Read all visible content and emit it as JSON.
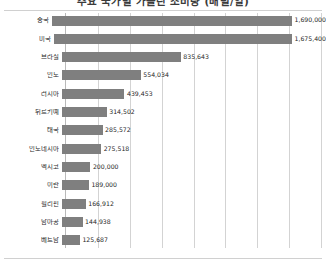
{
  "chart_data": {
    "type": "bar",
    "orientation": "horizontal",
    "title": "주요 국가별 가솔린 소비량 (배럴/일)",
    "xlabel": "",
    "ylabel": "",
    "grid": true,
    "legend": false,
    "xlim": [
      0,
      1800000
    ],
    "gridline_count": 8,
    "categories": [
      "중국",
      "미국",
      "브라질",
      "인도",
      "러시아",
      "튀르키예",
      "태국",
      "인도네시아",
      "멕시코",
      "이란",
      "필리핀",
      "남아공",
      "베트남"
    ],
    "values": [
      1690000,
      1675400,
      835643,
      554034,
      439453,
      314502,
      285572,
      275518,
      200000,
      189000,
      166912,
      144938,
      125687
    ],
    "value_labels": [
      "1,690,000",
      "1,675,400",
      "835,643",
      "554,034",
      "439,453",
      "314,502",
      "285,572",
      "275,518",
      "200,000",
      "189,000",
      "166,912",
      "144,938",
      "125,687"
    ],
    "bar_color": "#7f7f7f",
    "gridline_color": "#d3d3d3",
    "background_color": "#ffffff"
  }
}
